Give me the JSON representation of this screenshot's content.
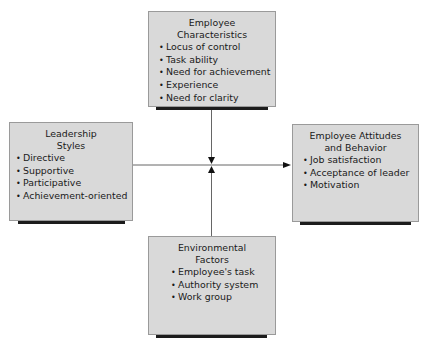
{
  "diagram": {
    "type": "path-goal-theory",
    "boxes": {
      "employee_characteristics": {
        "title_lines": [
          "Employee",
          "Characteristics"
        ],
        "items": [
          "Locus of control",
          "Task ability",
          "Need for achievement",
          "Experience",
          "Need for clarity"
        ]
      },
      "leadership_styles": {
        "title_lines": [
          "Leadership",
          "Styles"
        ],
        "items": [
          "Directive",
          "Supportive",
          "Participative",
          "Achievement-oriented"
        ]
      },
      "employee_attitudes": {
        "title_lines": [
          "Employee Attitudes",
          "and Behavior"
        ],
        "items": [
          "Job satisfaction",
          "Acceptance of leader",
          "Motivation"
        ]
      },
      "environmental_factors": {
        "title_lines": [
          "Environmental",
          "Factors"
        ],
        "items": [
          "Employee's task",
          "Authority system",
          "Work group"
        ]
      }
    },
    "colors": {
      "box_fill": "#d9d9d9",
      "box_border": "#9a9a9a",
      "shadow": "#1c1c1c",
      "connector": "#666666"
    }
  }
}
